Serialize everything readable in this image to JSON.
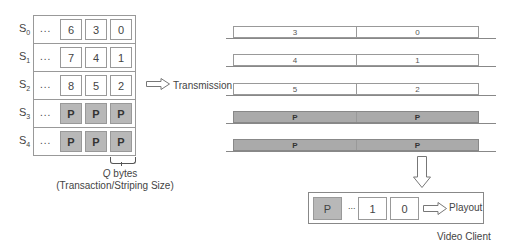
{
  "server_grid": {
    "rows": [
      {
        "label": "S",
        "sub": "0",
        "dots": "...",
        "cells": [
          "6",
          "3",
          "0"
        ],
        "parity": false
      },
      {
        "label": "S",
        "sub": "1",
        "dots": "...",
        "cells": [
          "7",
          "4",
          "1"
        ],
        "parity": false
      },
      {
        "label": "S",
        "sub": "2",
        "dots": "...",
        "cells": [
          "8",
          "5",
          "2"
        ],
        "parity": false
      },
      {
        "label": "S",
        "sub": "3",
        "dots": "...",
        "cells": [
          "P",
          "P",
          "P"
        ],
        "parity": true
      },
      {
        "label": "S",
        "sub": "4",
        "dots": "...",
        "cells": [
          "P",
          "P",
          "P"
        ],
        "parity": true
      }
    ],
    "brace_label_q": "Q",
    "brace_label_bytes": " bytes",
    "brace_caption": "(Transaction/Striping Size)"
  },
  "transmission": {
    "label": "Transmission",
    "rows": [
      {
        "left": "3",
        "right": "0",
        "parity": false
      },
      {
        "left": "4",
        "right": "1",
        "parity": false
      },
      {
        "left": "5",
        "right": "2",
        "parity": false
      },
      {
        "left": "P",
        "right": "P",
        "parity": true
      },
      {
        "left": "P",
        "right": "P",
        "parity": true
      }
    ]
  },
  "client": {
    "cells": [
      "P",
      "1",
      "0"
    ],
    "dots": "...",
    "playout_label": "Playout",
    "caption": "Video Client"
  },
  "colors": {
    "parity_fill": "#b8b8b8",
    "border": "#999999"
  }
}
